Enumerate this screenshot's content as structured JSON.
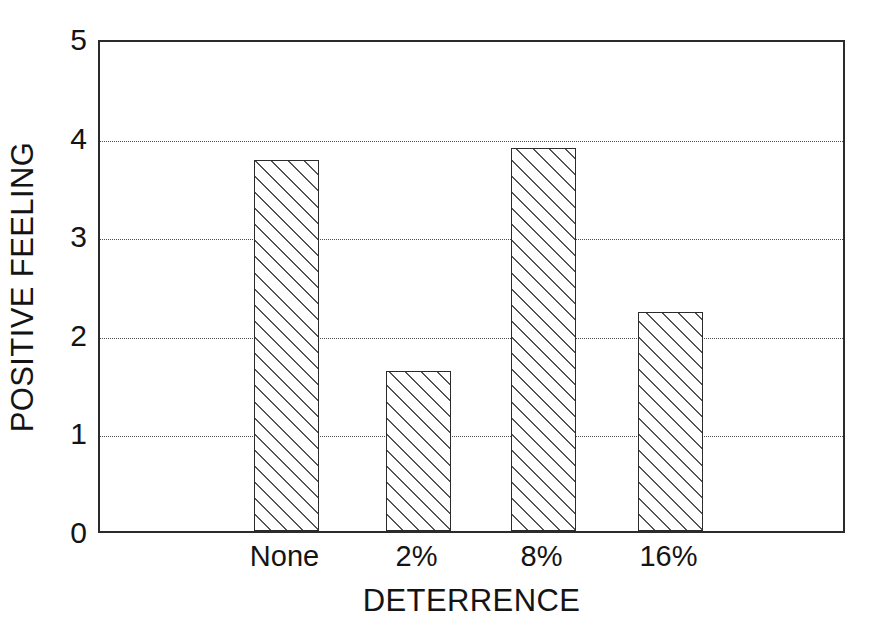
{
  "chart_data": {
    "type": "bar",
    "title": "",
    "xlabel": "DETERRENCE",
    "ylabel": "POSITIVE FEELING",
    "categories": [
      "None",
      "2%",
      "8%",
      "16%"
    ],
    "values": [
      3.76,
      1.62,
      3.88,
      2.22
    ],
    "series": [
      {
        "name": "Positive Feeling",
        "values": [
          3.76,
          1.62,
          3.88,
          2.22
        ]
      }
    ],
    "ylim": [
      0,
      5
    ],
    "yticks": [
      "0",
      "1",
      "2",
      "3",
      "4",
      "5"
    ],
    "ytick_values": [
      0,
      1,
      2,
      3,
      4,
      5
    ],
    "grid": true,
    "gridlines_at": [
      1,
      2,
      3,
      4
    ],
    "legend": "none",
    "bar_style": "hatched-diagonal",
    "colors": {
      "axis": "#2b2b2b",
      "grid": "#4a4a4a",
      "bar_fill": "#ffffff",
      "bar_edge": "#2b2b2b",
      "hatch": "#555555",
      "background": "#ffffff",
      "text": "#141414"
    }
  },
  "axes": {
    "y_title": "POSITIVE FEELING",
    "x_title": "DETERRENCE"
  },
  "yticks": [
    {
      "label": "5",
      "value": 5
    },
    {
      "label": "4",
      "value": 4
    },
    {
      "label": "3",
      "value": 3
    },
    {
      "label": "2",
      "value": 2
    },
    {
      "label": "1",
      "value": 1
    },
    {
      "label": "0",
      "value": 0
    }
  ],
  "bars": [
    {
      "label": "None",
      "value": 3.76
    },
    {
      "label": "2%",
      "value": 1.62
    },
    {
      "label": "8%",
      "value": 3.88
    },
    {
      "label": "16%",
      "value": 2.22
    }
  ]
}
